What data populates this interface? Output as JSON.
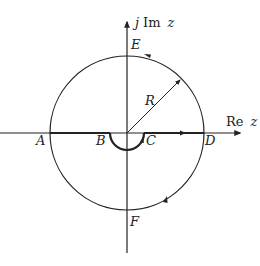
{
  "diagram": {
    "axes": {
      "real_label_prefix": "Re",
      "real_label_var": "z",
      "imag_label_prefix": "j",
      "imag_label_mid": "Im",
      "imag_label_var": "z"
    },
    "points": {
      "A": "A",
      "B": "B",
      "C": "C",
      "D": "D",
      "E": "E",
      "F": "F"
    },
    "radius_label": "R",
    "colors": {
      "line": "#222222",
      "background": "#ffffff"
    }
  }
}
